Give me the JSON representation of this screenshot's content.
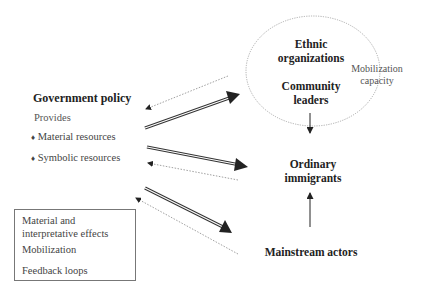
{
  "government": {
    "title": "Government policy",
    "provides": "Provides",
    "items": [
      {
        "bullet": "♦",
        "label": "Material resources"
      },
      {
        "bullet": "♦",
        "label": "Symbolic resources"
      }
    ]
  },
  "ellipse": {
    "line1": "Ethnic",
    "line2": "organizations",
    "line3": "Community",
    "line4": "leaders",
    "side_label_1": "Mobilization",
    "side_label_2": "capacity"
  },
  "ordinary": {
    "line1": "Ordinary",
    "line2": "immigrants"
  },
  "mainstream": "Mainstream actors",
  "legend": {
    "material_1": "Material and",
    "material_2": "interpretative effects",
    "mobilization": "Mobilization",
    "feedback": "Feedback loops"
  },
  "colors": {
    "line": "#333333",
    "dotted": "#888888",
    "text": "#222222"
  }
}
